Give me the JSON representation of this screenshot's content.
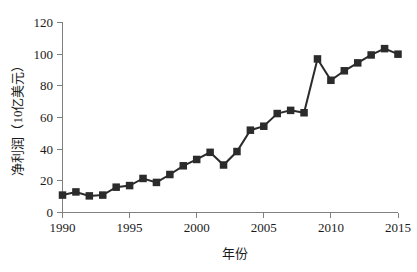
{
  "chart_data": {
    "type": "line",
    "title": "",
    "subtitle": "",
    "xlabel": "年份",
    "ylabel": "净利润（10亿美元）",
    "xlim": [
      1990,
      2015
    ],
    "ylim": [
      0,
      120
    ],
    "xticks": [
      1990,
      1995,
      2000,
      2005,
      2010,
      2015
    ],
    "yticks": [
      0,
      20,
      40,
      60,
      80,
      100,
      120
    ],
    "xtick_labels": [
      "1990",
      "1995",
      "2000",
      "2005",
      "2010",
      "2015"
    ],
    "ytick_labels": [
      "0",
      "20",
      "40",
      "60",
      "80",
      "100",
      "120"
    ],
    "grid": false,
    "legend": null,
    "legend_position": "none",
    "marker": "square",
    "marker_color": "#2b2b2b",
    "line_color": "#2b2b2b",
    "axis_color": "#808080",
    "background_color": "#ffffff",
    "x": [
      1990,
      1991,
      1992,
      1993,
      1994,
      1995,
      1996,
      1997,
      1998,
      1999,
      2000,
      2001,
      2002,
      2003,
      2004,
      2005,
      2006,
      2007,
      2008,
      2009,
      2010,
      2011,
      2012,
      2013,
      2014,
      2015
    ],
    "values": [
      11,
      13,
      10.5,
      11,
      16,
      17,
      21.5,
      19,
      24,
      29.5,
      33.5,
      38,
      30,
      38.5,
      52,
      54.5,
      62.5,
      64.5,
      63,
      97,
      83.5,
      89.5,
      94.5,
      99.5,
      103.5,
      100
    ],
    "series": [
      {
        "name": "净利润",
        "values": [
          11,
          13,
          10.5,
          11,
          16,
          17,
          21.5,
          19,
          24,
          29.5,
          33.5,
          38,
          30,
          38.5,
          52,
          54.5,
          62.5,
          64.5,
          63,
          97,
          83.5,
          89.5,
          94.5,
          99.5,
          103.5,
          100
        ]
      }
    ],
    "annotations": []
  },
  "axes": {
    "y_title": "净利润（10亿美元）",
    "x_title": "年份"
  }
}
